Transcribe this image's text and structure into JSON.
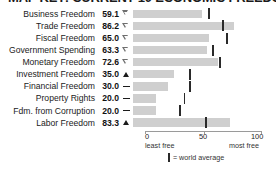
{
  "chart_data": {
    "type": "bar",
    "title": "MAP KEY: CURRENT 10 ECONOMIC FREEDOMS",
    "xlabel": "",
    "ylabel": "",
    "xlim": [
      0,
      100
    ],
    "grid": false,
    "orientation": "horizontal",
    "categories": [
      "Business Freedom",
      "Trade Freedom",
      "Fiscal Freedom",
      "Government Spending",
      "Monetary Freedom",
      "Investment Freedom",
      "Financial Freedom",
      "Property Rights",
      "Fdm. from Corruption",
      "Labor Freedom"
    ],
    "values": [
      59.1,
      86.2,
      65.0,
      63.3,
      72.6,
      35.0,
      30.0,
      20.0,
      20.0,
      83.3
    ],
    "value_labels": [
      "59.1",
      "86.2",
      "65.0",
      "63.3",
      "72.6",
      "35.0",
      "30.0",
      "20.0",
      "20.0",
      "83.3"
    ],
    "trends": [
      "down",
      "down",
      "down",
      "down",
      "down",
      "up",
      "flat",
      "flat",
      "flat",
      "up"
    ],
    "trend_glyphs": [
      "▽",
      "▽",
      "▽",
      "▽",
      "▽",
      "▲",
      "—",
      "—",
      "—",
      "▲"
    ],
    "series": [
      {
        "name": "Country score",
        "values": [
          59.1,
          86.2,
          65.0,
          63.3,
          72.6,
          35.0,
          30.0,
          20.0,
          20.0,
          83.3
        ]
      },
      {
        "name": "world average",
        "values": [
          65.0,
          77.0,
          80.0,
          68.0,
          74.0,
          49.0,
          49.0,
          44.0,
          40.0,
          62.0
        ]
      }
    ],
    "ticks": [
      {
        "value": 0,
        "label": "0",
        "sublabel": "least free"
      },
      {
        "value": 50,
        "label": "50",
        "sublabel": ""
      },
      {
        "value": 100,
        "label": "100",
        "sublabel": "most free"
      }
    ],
    "legend": {
      "position": "bottom",
      "entries": [
        {
          "marker": "world-average-marker",
          "label": "= world average"
        }
      ]
    },
    "colors": {
      "bar": "#cfcfcf",
      "marker": "#2a2a2a",
      "axis": "#9a9a9a",
      "text": "#1b1b1b",
      "background": "#ffffff"
    }
  },
  "axis": {
    "left_label": "0",
    "mid_label": "50",
    "right_label": "100",
    "left_sub": "least free",
    "right_sub": "most free"
  },
  "legend": {
    "text": "= world average"
  }
}
